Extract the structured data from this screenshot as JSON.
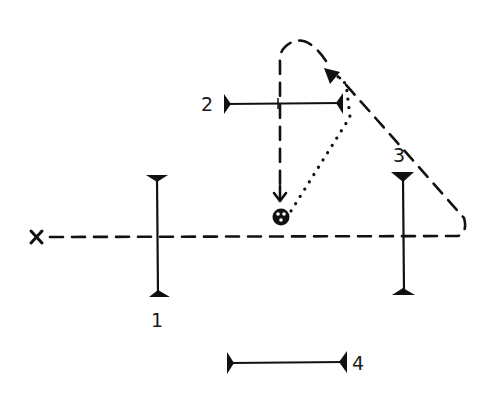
{
  "diagram": {
    "type": "optical path schematic (hand-drawn)",
    "source_marker": {
      "symbol": "×",
      "name": "origin-point"
    },
    "center_object": {
      "symbol": "⊗",
      "name": "sample-target"
    },
    "elements": [
      {
        "id": "1",
        "label": "1",
        "orientation": "vertical"
      },
      {
        "id": "2",
        "label": "2",
        "orientation": "horizontal"
      },
      {
        "id": "3",
        "label": "3",
        "orientation": "vertical"
      },
      {
        "id": "4",
        "label": "4",
        "orientation": "horizontal"
      }
    ],
    "paths": [
      {
        "style": "dashed",
        "description": "axis from × through elements 1 and 3, looping back over the top and down through element 2 to the target"
      },
      {
        "style": "dotted",
        "description": "from target up to arrowhead near top right"
      }
    ],
    "colors": {
      "ink": "#111111",
      "background": "#ffffff"
    }
  }
}
